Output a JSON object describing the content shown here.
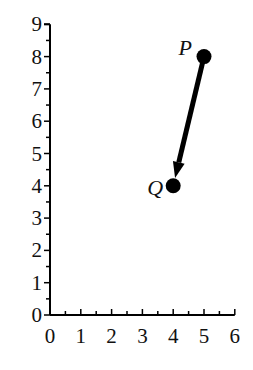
{
  "chart_data": {
    "type": "scatter",
    "title": "",
    "xlabel": "",
    "ylabel": "",
    "xlim": [
      0,
      6
    ],
    "ylim": [
      0,
      9
    ],
    "grid": false,
    "x_ticks": [
      0,
      1,
      2,
      3,
      4,
      5,
      6
    ],
    "y_ticks": [
      0,
      1,
      2,
      3,
      4,
      5,
      6,
      7,
      8,
      9
    ],
    "x_tick_labels": [
      "0",
      "1",
      "2",
      "3",
      "4",
      "5",
      "6"
    ],
    "y_tick_labels": [
      "0",
      "1",
      "2",
      "3",
      "4",
      "5",
      "6",
      "7",
      "8",
      "9"
    ],
    "points": [
      {
        "label": "P",
        "x": 5,
        "y": 8
      },
      {
        "label": "Q",
        "x": 4,
        "y": 4
      }
    ],
    "annotations": [
      {
        "type": "arrow",
        "from": "P",
        "to": "Q",
        "from_xy": [
          5,
          8
        ],
        "to_xy": [
          4,
          4
        ]
      }
    ]
  },
  "colors": {
    "ink": "#000000",
    "background": "#ffffff"
  }
}
